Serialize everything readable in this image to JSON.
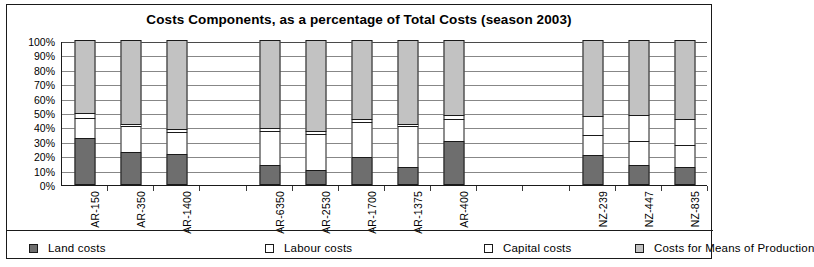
{
  "chart_data": {
    "type": "bar",
    "subtype": "stacked-percentage-column",
    "title": "Costs Components, as a percentage of Total Costs (season 2003)",
    "xlabel": "",
    "ylabel": "",
    "ylim": [
      0,
      100
    ],
    "ytick_labels": [
      "100%",
      "90%",
      "80%",
      "70%",
      "60%",
      "50%",
      "40%",
      "30%",
      "20%",
      "10%",
      "0%"
    ],
    "ytick_values": [
      100,
      90,
      80,
      70,
      60,
      50,
      40,
      30,
      20,
      10,
      0
    ],
    "grid": true,
    "legend_position": "bottom",
    "categories": [
      "AR-150",
      "AR-350",
      "AR-1400",
      "",
      "AR-6350",
      "AR-2530",
      "AR-1700",
      "AR-1375",
      "AR-400",
      "",
      "",
      "NZ-239",
      "NZ-447",
      "NZ-835"
    ],
    "series": [
      {
        "name": "Land costs",
        "color": "#6e6e6e",
        "values": [
          32,
          22,
          21,
          null,
          13,
          10,
          19,
          12,
          30,
          null,
          null,
          20,
          13,
          12
        ]
      },
      {
        "name": "Labour costs",
        "color": "#ffffff",
        "values": [
          14,
          18,
          15,
          null,
          24,
          25,
          24,
          28,
          15,
          null,
          null,
          14,
          17,
          15
        ]
      },
      {
        "name": "Capital costs",
        "color": "#ffffff",
        "values": [
          3,
          2,
          2,
          null,
          2,
          2,
          2,
          2,
          3,
          null,
          null,
          13,
          18,
          18
        ]
      },
      {
        "name": "Costs for Means of Production",
        "color": "#c2c2c2",
        "values": [
          51,
          58,
          62,
          null,
          61,
          63,
          55,
          58,
          52,
          null,
          null,
          53,
          52,
          55
        ]
      }
    ]
  },
  "legend": {
    "items": [
      {
        "label": "Land costs",
        "swatch": "land-swatch"
      },
      {
        "label": "Labour costs",
        "swatch": "labour-swatch"
      },
      {
        "label": "Capital costs",
        "swatch": "capital-swatch"
      },
      {
        "label": "Costs for Means of Production",
        "swatch": "means-swatch"
      }
    ]
  }
}
